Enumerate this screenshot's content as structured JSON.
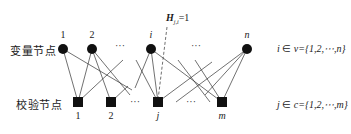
{
  "labels": {
    "variable_row": "变量节点",
    "check_row": "校验节点",
    "variable_set": {
      "lhs": "i",
      "rel": " ∈ ",
      "set": "v={1,2,⋯,n}"
    },
    "check_set": {
      "lhs": "j",
      "rel": " ∈ ",
      "set": "c={1,2,⋯,m}"
    },
    "edge_annotation": {
      "symbol": "H",
      "subscript": "j,i",
      "value": "=1"
    }
  },
  "variable_nodes": [
    {
      "id": "v1",
      "label": "1",
      "x": 63,
      "italic": false
    },
    {
      "id": "v2",
      "label": "2",
      "x": 92,
      "italic": false
    },
    {
      "id": "vi",
      "label": "i",
      "x": 151,
      "italic": true
    },
    {
      "id": "vn",
      "label": "n",
      "x": 247,
      "italic": true
    }
  ],
  "check_nodes": [
    {
      "id": "c1",
      "label": "1",
      "x": 78,
      "italic": false
    },
    {
      "id": "c2",
      "label": "2",
      "x": 111,
      "italic": false
    },
    {
      "id": "cj",
      "label": "j",
      "x": 158,
      "italic": true
    },
    {
      "id": "cm",
      "label": "m",
      "x": 222,
      "italic": true
    }
  ],
  "ellipses": {
    "top": [
      {
        "x": 120,
        "text": "···"
      },
      {
        "x": 196,
        "text": "···"
      }
    ],
    "bottom": [
      {
        "x": 135,
        "text": "···"
      },
      {
        "x": 191,
        "text": "···"
      }
    ]
  },
  "colors": {
    "node": "#111111",
    "edge": "#333333",
    "background": "#ffffff"
  }
}
